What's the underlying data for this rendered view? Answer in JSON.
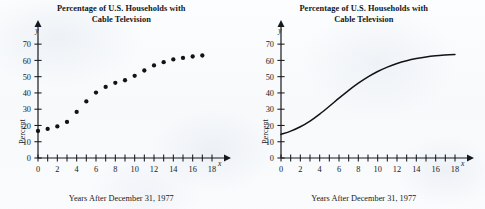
{
  "figure": {
    "background_color": "#fbfcfd",
    "ink_color": "#15191e",
    "panels": [
      {
        "id": "scatter-panel",
        "title_line1": "Percentage of U.S. Households with",
        "title_line2": "Cable Television",
        "xlabel": "Years After December 31, 1977",
        "ylabel": "Percent",
        "x_axis_var": "x",
        "y_axis_var": "y"
      },
      {
        "id": "curve-panel",
        "title_line1": "Percentage of U.S. Households with",
        "title_line2": "Cable Television",
        "xlabel": "Years After December 31, 1977",
        "ylabel": "Percent",
        "x_axis_var": "x",
        "y_axis_var": "y"
      }
    ]
  },
  "chart_data": [
    {
      "type": "scatter",
      "title": "Percentage of U.S. Households with Cable Television",
      "xlabel": "Years After December 31, 1977",
      "ylabel": "Percent",
      "xlim": [
        0,
        18
      ],
      "ylim": [
        0,
        75
      ],
      "xticks": [
        0,
        1,
        2,
        3,
        4,
        5,
        6,
        7,
        8,
        9,
        10,
        11,
        12,
        13,
        14,
        15,
        16,
        17,
        18
      ],
      "xticklabels": [
        "0",
        "",
        "2",
        "",
        "4",
        "",
        "6",
        "",
        "8",
        "",
        "10",
        "",
        "12",
        "",
        "14",
        "",
        "16",
        "",
        "18"
      ],
      "yticks": [
        0,
        10,
        20,
        30,
        40,
        50,
        60,
        70
      ],
      "yticklabels": [
        "0",
        "10",
        "20",
        "30",
        "40",
        "50",
        "60",
        "70"
      ],
      "grid": false,
      "legend": "none",
      "marker": "filled-circle",
      "marker_color": "#111316",
      "x": [
        0,
        1,
        2,
        3,
        4,
        5,
        6,
        7,
        8,
        9,
        10,
        11,
        12,
        13,
        14,
        15,
        16,
        17
      ],
      "y": [
        16.6,
        17.9,
        19.4,
        22.2,
        28.3,
        34.8,
        40.2,
        43.7,
        46.2,
        47.8,
        50.5,
        53.8,
        56.9,
        58.9,
        60.6,
        61.5,
        62.4,
        63.0
      ]
    },
    {
      "type": "line",
      "title": "Percentage of U.S. Households with Cable Television",
      "xlabel": "Years After December 31, 1977",
      "ylabel": "Percent",
      "xlim": [
        0,
        18
      ],
      "ylim": [
        0,
        75
      ],
      "xticks": [
        0,
        1,
        2,
        3,
        4,
        5,
        6,
        7,
        8,
        9,
        10,
        11,
        12,
        13,
        14,
        15,
        16,
        17,
        18
      ],
      "xticklabels": [
        "0",
        "",
        "2",
        "",
        "4",
        "",
        "6",
        "",
        "8",
        "",
        "10",
        "",
        "12",
        "",
        "14",
        "",
        "16",
        "",
        "18"
      ],
      "yticks": [
        0,
        10,
        20,
        30,
        40,
        50,
        60,
        70
      ],
      "yticklabels": [
        "0",
        "10",
        "20",
        "30",
        "40",
        "50",
        "60",
        "70"
      ],
      "grid": false,
      "legend": "none",
      "line_color": "#111316",
      "x": [
        0,
        1,
        2,
        3,
        4,
        5,
        6,
        7,
        8,
        9,
        10,
        11,
        12,
        13,
        14,
        15,
        16,
        17,
        18
      ],
      "y": [
        14.5,
        16.5,
        19.2,
        22.7,
        27.0,
        31.8,
        36.8,
        41.6,
        46.0,
        49.9,
        53.2,
        55.9,
        58.1,
        59.8,
        61.1,
        62.1,
        62.8,
        63.3,
        63.7
      ]
    }
  ]
}
